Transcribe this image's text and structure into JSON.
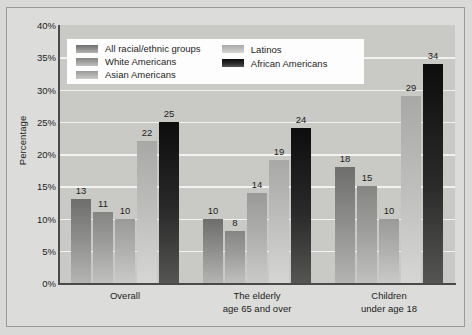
{
  "chart_data": {
    "type": "bar",
    "title": "",
    "subtitle": "",
    "xlabel": "",
    "ylabel": "Percentage",
    "ylim": [
      0,
      40
    ],
    "ytick_labels": [
      "40%",
      "35%",
      "30%",
      "25%",
      "20%",
      "15%",
      "10%",
      "5%",
      "0%"
    ],
    "ytick_values": [
      40,
      35,
      30,
      25,
      20,
      15,
      10,
      5,
      0
    ],
    "grid": true,
    "legend_position": "inside-top-left",
    "value_labels": true,
    "categories": [
      "Overall",
      "The elderly age 65 and over",
      "Children under age 18"
    ],
    "category_lines": [
      [
        "Overall"
      ],
      [
        "The elderly",
        "age 65 and over"
      ],
      [
        "Children",
        "under age 18"
      ]
    ],
    "series": [
      {
        "name": "All racial/ethnic groups",
        "color": "#8c8c8a",
        "values": [
          13,
          10,
          18
        ]
      },
      {
        "name": "White Americans",
        "color": "#9d9d9b",
        "values": [
          11,
          8,
          15
        ]
      },
      {
        "name": "Asian Americans",
        "color": "#aeaeac",
        "values": [
          10,
          14,
          10
        ]
      },
      {
        "name": "Latinos",
        "color": "#bcbcba",
        "values": [
          22,
          19,
          29
        ]
      },
      {
        "name": "African Americans",
        "color": "#1a1a1a",
        "values": [
          25,
          24,
          34
        ]
      }
    ]
  },
  "legend": {
    "column1": [
      "All racial/ethnic groups",
      "White Americans",
      "Asian Americans"
    ],
    "column2": [
      "Latinos",
      "African Americans"
    ]
  }
}
